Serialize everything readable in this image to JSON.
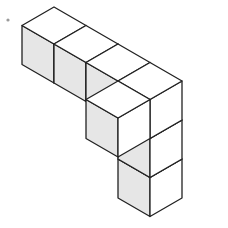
{
  "diagram": {
    "type": "isometric-cube-figure",
    "cube_count": 7,
    "colors": {
      "stroke": "#222222",
      "top_face": "#ffffff",
      "left_face": "#e6e6e6",
      "right_face": "#ffffff",
      "background": "#ffffff",
      "dot": "#9a9a9a"
    },
    "geometry": {
      "dx": 32,
      "dy": 18.5,
      "height": 39
    },
    "cubes": [
      {
        "id": "row-1",
        "x": 0,
        "y": 0,
        "z": 0
      },
      {
        "id": "row-2",
        "x": 1,
        "y": 0,
        "z": 0
      },
      {
        "id": "row-3",
        "x": 2,
        "y": 0,
        "z": 0
      },
      {
        "id": "row-4",
        "x": 3,
        "y": 0,
        "z": 0
      },
      {
        "id": "branch-back",
        "x": 3,
        "y": -1,
        "z": 0
      },
      {
        "id": "column-1",
        "x": 3,
        "y": 0,
        "z": -1
      },
      {
        "id": "column-2",
        "x": 3,
        "y": 0,
        "z": -2
      }
    ]
  }
}
